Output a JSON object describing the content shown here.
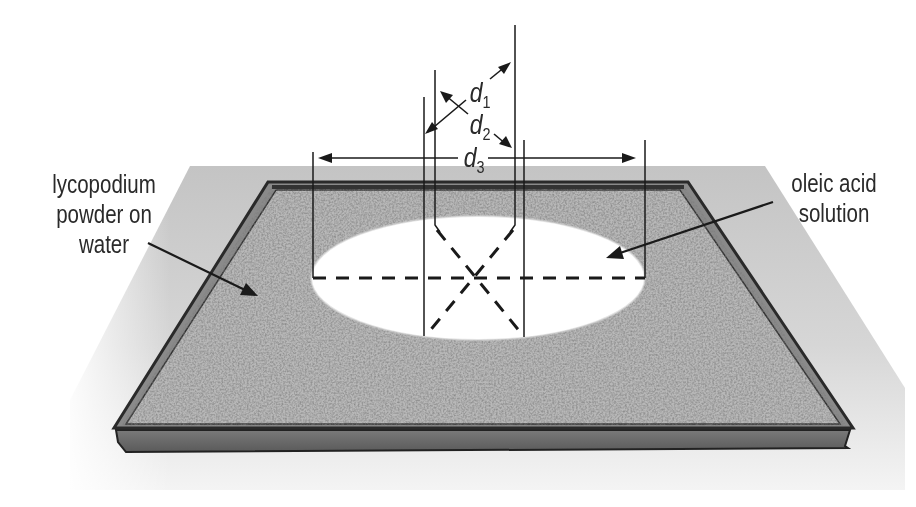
{
  "diagram": {
    "labels": {
      "left": [
        "lycopodium",
        "powder on",
        "water"
      ],
      "right": [
        "oleic acid",
        "solution"
      ]
    },
    "dimensions": [
      {
        "id": "d1",
        "symbol": "d",
        "subscript": "1"
      },
      {
        "id": "d2",
        "symbol": "d",
        "subscript": "2"
      },
      {
        "id": "d3",
        "symbol": "d",
        "subscript": "3"
      }
    ],
    "colors": {
      "background": "#ffffff",
      "floor_shadow": "#c9c9c9",
      "tray_rim": "#3a3a3a",
      "tray_side": "#6e6e6e",
      "powder": "#b5b5b5",
      "film": "#ffffff",
      "lines": "#1a1a1a"
    }
  }
}
